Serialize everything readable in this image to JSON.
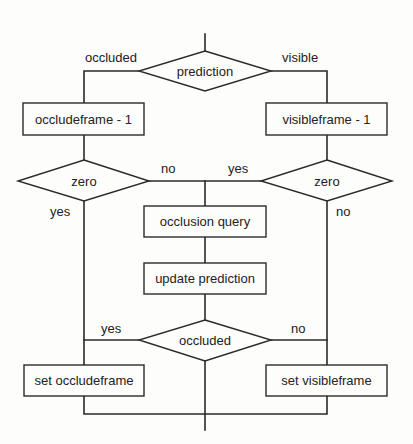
{
  "diagram": {
    "type": "flowchart",
    "colors": {
      "line": "#2a2a2a",
      "background": "#fdfdfb",
      "text": "#222222"
    },
    "nodes": {
      "prediction": {
        "shape": "decision",
        "label": "prediction"
      },
      "occludeframe_dec": {
        "shape": "process",
        "label": "occludeframe - 1"
      },
      "visibleframe_dec": {
        "shape": "process",
        "label": "visibleframe - 1"
      },
      "zero_left": {
        "shape": "decision",
        "label": "zero"
      },
      "zero_right": {
        "shape": "decision",
        "label": "zero"
      },
      "occlusion_query": {
        "shape": "process",
        "label": "occlusion query"
      },
      "update_prediction": {
        "shape": "process",
        "label": "update prediction"
      },
      "occluded": {
        "shape": "decision",
        "label": "occluded"
      },
      "set_occludeframe": {
        "shape": "process",
        "label": "set occludeframe"
      },
      "set_visibleframe": {
        "shape": "process",
        "label": "set visibleframe"
      }
    },
    "edge_labels": {
      "prediction_left": "occluded",
      "prediction_right": "visible",
      "zero_left_no": "no",
      "zero_left_yes": "yes",
      "zero_right_yes": "yes",
      "zero_right_no": "no",
      "occluded_yes": "yes",
      "occluded_no": "no"
    },
    "edges": [
      {
        "from": "entry",
        "to": "prediction"
      },
      {
        "from": "prediction",
        "to": "occludeframe_dec",
        "label": "occluded"
      },
      {
        "from": "prediction",
        "to": "visibleframe_dec",
        "label": "visible"
      },
      {
        "from": "occludeframe_dec",
        "to": "zero_left"
      },
      {
        "from": "visibleframe_dec",
        "to": "zero_right"
      },
      {
        "from": "zero_left",
        "to": "occlusion_query",
        "label": "no"
      },
      {
        "from": "zero_right",
        "to": "occlusion_query",
        "label": "yes"
      },
      {
        "from": "zero_left",
        "to": "merge",
        "label": "yes"
      },
      {
        "from": "zero_right",
        "to": "merge",
        "label": "no"
      },
      {
        "from": "occlusion_query",
        "to": "update_prediction"
      },
      {
        "from": "update_prediction",
        "to": "occluded"
      },
      {
        "from": "occluded",
        "to": "set_occludeframe",
        "label": "yes"
      },
      {
        "from": "occluded",
        "to": "set_visibleframe",
        "label": "no"
      },
      {
        "from": "occluded",
        "to": "merge"
      },
      {
        "from": "set_occludeframe",
        "to": "merge"
      },
      {
        "from": "set_visibleframe",
        "to": "merge"
      },
      {
        "from": "merge",
        "to": "exit"
      }
    ]
  }
}
